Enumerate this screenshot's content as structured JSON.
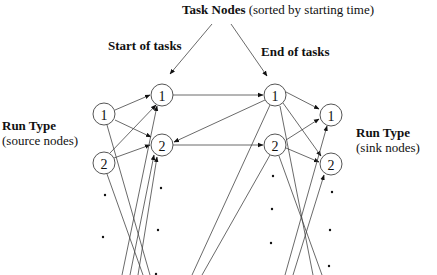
{
  "title": {
    "bold": "Task Nodes",
    "normal": " (sorted by starting time)"
  },
  "column_labels": {
    "start": "Start of tasks",
    "end": "End of tasks"
  },
  "source_label": {
    "bold": "Run Type",
    "normal": "(source nodes)"
  },
  "sink_label": {
    "bold": "Run Type",
    "normal": "(sink nodes)"
  },
  "nodes": {
    "source": [
      "1",
      "2"
    ],
    "start": [
      "1",
      "2"
    ],
    "end": [
      "1",
      "2"
    ],
    "sink": [
      "1",
      "2"
    ]
  },
  "colors": {
    "stroke": "#444444",
    "text": "#111111",
    "background": "#ffffff"
  }
}
